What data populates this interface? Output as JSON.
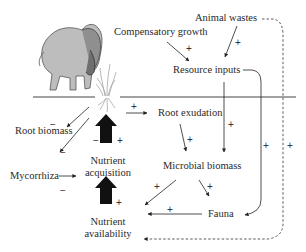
{
  "diagram": {
    "nodes": {
      "compensatory_growth": "Compensatory growth",
      "animal_wastes": "Animal wastes",
      "resource_inputs": "Resource inputs",
      "root_exudation": "Root exudation",
      "root_biomass": "Root biomass",
      "mycorrhiza": "Mycorrhiza",
      "nutrient_acquisition_1": "Nutrient",
      "nutrient_acquisition_2": "acquisition",
      "microbial_biomass": "Microbial biomass",
      "fauna": "Fauna",
      "nutrient_availability_1": "Nutrient",
      "nutrient_availability_2": "availability"
    },
    "signs": {
      "plus": "+",
      "minus": "−"
    },
    "icons": {
      "bison": "bison-illustration",
      "grass": "grass-plant-illustration"
    },
    "edges": [
      {
        "from": "Compensatory growth",
        "to": "Resource inputs",
        "sign": "+"
      },
      {
        "from": "Animal wastes",
        "to": "Resource inputs",
        "sign": "+"
      },
      {
        "from": "Animal wastes",
        "to": "Nutrient availability",
        "sign": "+",
        "style": "dashed"
      },
      {
        "from": "Resource inputs",
        "to": "Microbial biomass",
        "sign": "+"
      },
      {
        "from": "Resource inputs",
        "to": "Fauna",
        "sign": "+"
      },
      {
        "from": "Plant",
        "to": "Root exudation",
        "sign": "+"
      },
      {
        "from": "Plant",
        "to": "Root biomass",
        "sign": "−"
      },
      {
        "from": "Plant",
        "to": "Mycorrhiza",
        "sign": "−"
      },
      {
        "from": "Mycorrhiza",
        "to": "Nutrient acquisition",
        "sign": "−"
      },
      {
        "from": "Nutrient acquisition",
        "to": "Plant",
        "sign": "+"
      },
      {
        "from": "Root exudation",
        "to": "Microbial biomass",
        "sign": "+"
      },
      {
        "from": "Microbial biomass",
        "to": "Nutrient availability",
        "sign": "+"
      },
      {
        "from": "Microbial biomass",
        "to": "Fauna",
        "sign": "+"
      },
      {
        "from": "Fauna",
        "to": "Nutrient availability",
        "sign": "+"
      },
      {
        "from": "Nutrient availability",
        "to": "Nutrient acquisition",
        "sign": "+"
      }
    ]
  }
}
